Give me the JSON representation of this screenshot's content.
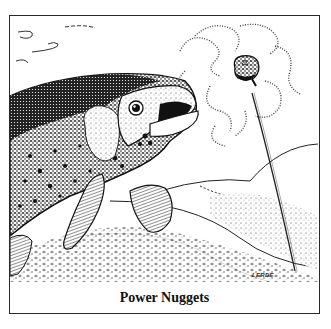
{
  "figure": {
    "caption": "Power Nuggets",
    "signature": "LERDE",
    "illustration": {
      "subject": "trout approaching bait nugget on fishing line",
      "style": "black-and-white pen-and-ink stipple drawing",
      "elements": [
        "trout-head-and-body",
        "pectoral-fin",
        "pelvic-fin",
        "bait-nugget",
        "fishing-line",
        "scent-trail",
        "river-bottom-hills",
        "water-current-swirls"
      ]
    },
    "colors": {
      "ink": "#1a1a1a",
      "paper": "#ffffff",
      "border": "#2a2a2a"
    }
  }
}
